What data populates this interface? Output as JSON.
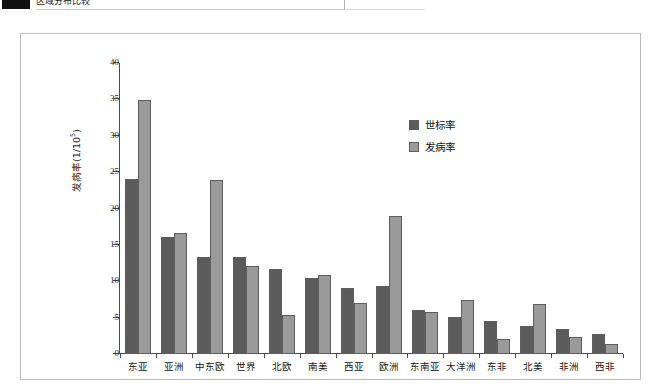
{
  "page": {
    "top_strip": {
      "caption_text": "区域分布比较",
      "swatch_color": "#101010"
    }
  },
  "legend": {
    "position": "inside-top-right",
    "items": [
      {
        "label": "世标率",
        "color": "#5b5b5b"
      },
      {
        "label": "发病率",
        "color": "#9a9a9a"
      }
    ]
  },
  "axis": {
    "y_title_main": "发病率(1/10",
    "y_title_sup": "5",
    "y_title_tail": ")",
    "y_ticks": [
      "0",
      "5",
      "10",
      "15",
      "20",
      "25",
      "30",
      "35",
      "40"
    ]
  },
  "chart_data": {
    "type": "bar",
    "title": "",
    "subtitle": "",
    "xlabel": "",
    "ylabel": "发病率(1/10^5)",
    "ylim": [
      0,
      40
    ],
    "ytick_step": 5,
    "grid": false,
    "legend_position": "inside-top-right",
    "categories": [
      "东亚",
      "亚洲",
      "中东欧",
      "世界",
      "北欧",
      "南美",
      "西亚",
      "欧洲",
      "东南亚",
      "大洋洲",
      "东非",
      "北美",
      "非洲",
      "西非"
    ],
    "series": [
      {
        "name": "世标率",
        "color": "#5b5b5b",
        "values": [
          24.1,
          16.1,
          13.4,
          13.3,
          11.7,
          10.5,
          9.1,
          9.4,
          6.0,
          5.1,
          4.5,
          3.9,
          3.4,
          2.7
        ]
      },
      {
        "name": "发病率",
        "color": "#9a9a9a",
        "values": [
          34.9,
          16.6,
          23.9,
          12.1,
          5.4,
          10.9,
          7.0,
          19.0,
          5.8,
          7.4,
          2.0,
          6.9,
          2.4,
          1.4
        ]
      }
    ]
  }
}
